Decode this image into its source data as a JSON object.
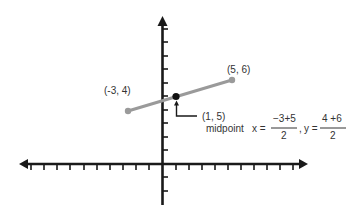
{
  "diagram": {
    "type": "coordinate-plane-midpoint",
    "colors": {
      "axis": "#1a1a1a",
      "segment": "#9a9a9a",
      "midpoint_dot": "#111111",
      "text": "#333333"
    },
    "points": {
      "left": {
        "label": "(-3, 4)",
        "x": -3,
        "y": 4
      },
      "right": {
        "label": "(5, 6)",
        "x": 5,
        "y": 6
      },
      "midpoint": {
        "label": "(1, 5)",
        "x": 1,
        "y": 5,
        "caption": "midpoint"
      }
    },
    "formula": {
      "x_prefix": "x =",
      "x_numerator": "−3+5",
      "x_denominator": "2",
      "separator": ",",
      "y_prefix": "y =",
      "y_numerator": "4 +6",
      "y_denominator": "2"
    }
  }
}
